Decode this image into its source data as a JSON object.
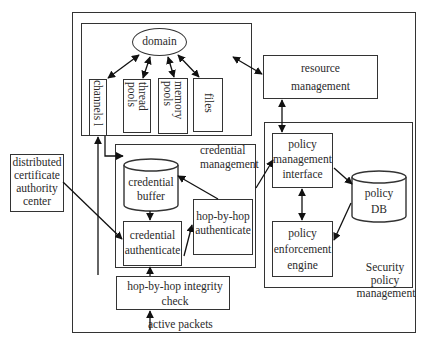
{
  "diagram": {
    "title": "",
    "nodes": {
      "domain": "domain",
      "channels": "channels l",
      "thread_pools": [
        "thread",
        "pools"
      ],
      "memory_pools": [
        "memory",
        "pools"
      ],
      "files": "files",
      "resource_management": [
        "resource",
        "management"
      ],
      "credential_management": [
        "credential",
        "management"
      ],
      "credential_buffer": [
        "credential",
        "buffer"
      ],
      "hop_by_hop_authenticate": [
        "hop-by-hop",
        "authenticate"
      ],
      "credential_authenticate": [
        "credential",
        "authenticate"
      ],
      "policy_management_interface": [
        "policy",
        "management",
        "interface"
      ],
      "policy_db": [
        "policy",
        "DB"
      ],
      "policy_enforcement_engine": [
        "policy",
        "enforcement",
        "engine"
      ],
      "security_policy_management": [
        "Security",
        "policy",
        "management"
      ],
      "distributed_ca": [
        "distributed",
        "certificate",
        "authority",
        "center"
      ],
      "integrity_check": [
        "hop-by-hop integrity",
        "check"
      ],
      "active_packets": "active packets"
    },
    "edges": [
      {
        "from": "domain",
        "to": "channels",
        "type": "bidirectional"
      },
      {
        "from": "domain",
        "to": "thread_pools",
        "type": "bidirectional"
      },
      {
        "from": "domain",
        "to": "memory_pools",
        "type": "bidirectional"
      },
      {
        "from": "domain",
        "to": "files",
        "type": "bidirectional"
      },
      {
        "from": "domain_group",
        "to": "resource_management",
        "type": "bidirectional"
      },
      {
        "from": "resource_management",
        "to": "policy_management_interface",
        "type": "bidirectional"
      },
      {
        "from": "policy_management_interface",
        "to": "policy_enforcement_engine",
        "type": "bidirectional"
      },
      {
        "from": "policy_management_interface",
        "to": "policy_db",
        "type": "directed"
      },
      {
        "from": "policy_db",
        "to": "policy_enforcement_engine",
        "type": "directed"
      },
      {
        "from": "credential_buffer",
        "to": "credential_authenticate",
        "type": "directed"
      },
      {
        "from": "credential_authenticate",
        "to": "hop_by_hop_authenticate",
        "type": "directed"
      },
      {
        "from": "hop_by_hop_authenticate",
        "to": "credential_buffer",
        "type": "directed"
      },
      {
        "from": "credential_management",
        "to": "policy_management_interface",
        "type": "directed"
      },
      {
        "from": "distributed_ca",
        "to": "credential_authenticate",
        "type": "directed"
      },
      {
        "from": "integrity_check",
        "to": "credential_authenticate",
        "type": "directed"
      },
      {
        "from": "active_packets",
        "to": "integrity_check",
        "type": "directed"
      },
      {
        "from": "credential_authenticate",
        "to": "channels",
        "type": "directed"
      },
      {
        "from": "channels",
        "to": "credential_buffer",
        "type": "directed"
      }
    ]
  }
}
